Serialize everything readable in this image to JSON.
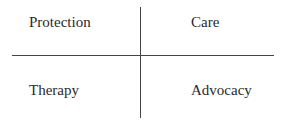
{
  "quadrants": {
    "top_left": "Protection",
    "top_right": "Care",
    "bottom_left": "Therapy",
    "bottom_right": "Advocacy"
  }
}
